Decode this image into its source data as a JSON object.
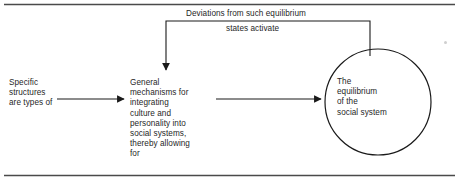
{
  "figure": {
    "type": "flow-diagram",
    "background_color": "#ffffff",
    "line_color": "#1a1a1a",
    "text_color": "#1f1f1f",
    "rules": {
      "top_rule": "horizontal-rule",
      "bottom_rule": "horizontal-rule"
    },
    "nodes": {
      "left_text": "Specific\nstructures\nare types of",
      "middle_text": "General\nmechanisms for\nintegrating\nculture and\npersonality into\nsocial systems,\nthereby allowing\nfor",
      "circle_text": "The\nequilibrium\nof the\nsocial system"
    },
    "feedback_label": {
      "line_1": "Deviations from such equilibrium",
      "line_2": "states activate"
    },
    "arrows": [
      {
        "name": "arrow-left-to-middle",
        "from": "left_text",
        "to": "middle_text",
        "direction": "right"
      },
      {
        "name": "arrow-middle-to-circle",
        "from": "middle_text",
        "to": "circle_text",
        "direction": "right"
      },
      {
        "name": "arrow-feedback-circle-to-middle",
        "from": "circle_text",
        "to": "middle_text",
        "direction": "down",
        "label": "Deviations from such equilibrium states activate"
      }
    ]
  }
}
